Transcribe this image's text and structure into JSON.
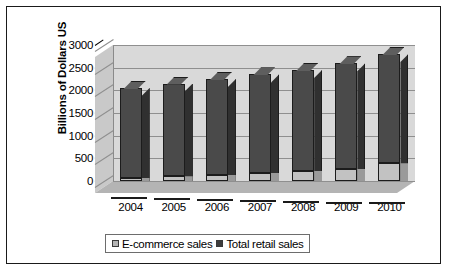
{
  "chart_data": {
    "type": "bar",
    "title": "",
    "subtitle": "",
    "xlabel": "",
    "ylabel": "Billions of Dollars US",
    "categories": [
      "2004",
      "2005",
      "2006",
      "2007",
      "2008",
      "2009",
      "2010"
    ],
    "series": [
      {
        "name": "E-commerce sales",
        "color": "#b5b5b5",
        "values": [
          70,
          105,
          140,
          180,
          225,
          270,
          390
        ]
      },
      {
        "name": "Total retail sales",
        "color": "#3d3d3d",
        "values": [
          2050,
          2150,
          2250,
          2350,
          2450,
          2600,
          2800
        ]
      }
    ],
    "ylim": [
      0,
      3000
    ],
    "yticks": [
      0,
      500,
      1000,
      1500,
      2000,
      2500,
      3000
    ],
    "ytick_labels": [
      "0",
      "500",
      "1000",
      "1500",
      "2000",
      "2500",
      "3000"
    ],
    "grid": true,
    "grid_axis": "y",
    "legend_position": "bottom",
    "stacked": true,
    "three_d": true,
    "plot_area_color": "#d9d9d9",
    "floor_color": "#b4b4b4",
    "gridline_color": "#8f8f8f",
    "border_color": "#1a1a1a",
    "background_color": "#ffffff"
  },
  "legend": {
    "items": [
      {
        "label": "E-commerce sales",
        "swatch": "#b5b5b5"
      },
      {
        "label": "Total retail sales",
        "swatch": "#3d3d3d"
      }
    ]
  }
}
